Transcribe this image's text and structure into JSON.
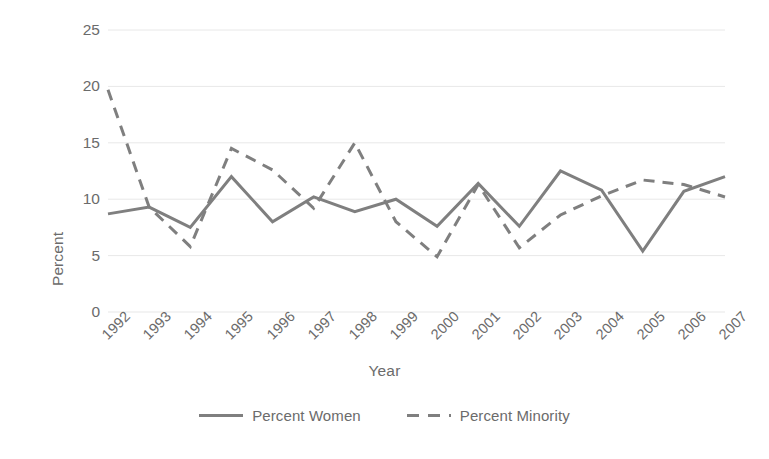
{
  "chart_data": {
    "type": "line",
    "title": "",
    "subtitle": "",
    "xlabel": "Year",
    "ylabel": "Percent",
    "categories": [
      "1992",
      "1993",
      "1994",
      "1995",
      "1996",
      "1997",
      "1998",
      "1999",
      "2000",
      "2001",
      "2002",
      "2003",
      "2004",
      "2005",
      "2006",
      "2007"
    ],
    "x": [
      1992,
      1993,
      1994,
      1995,
      1996,
      1997,
      1998,
      1999,
      2000,
      2001,
      2002,
      2003,
      2004,
      2005,
      2006,
      2007
    ],
    "series": [
      {
        "name": "Percent Women",
        "style": "solid",
        "color": "#7f7f7f",
        "values": [
          8.7,
          9.3,
          7.5,
          12.0,
          8.0,
          10.2,
          8.9,
          10.0,
          7.6,
          11.4,
          7.6,
          12.5,
          10.8,
          5.4,
          10.7,
          12.0
        ]
      },
      {
        "name": "Percent Minority",
        "style": "dashed",
        "color": "#7f7f7f",
        "values": [
          19.7,
          9.3,
          5.8,
          14.5,
          12.6,
          9.2,
          15.0,
          8.0,
          4.9,
          11.3,
          5.7,
          8.6,
          10.3,
          11.7,
          11.3,
          10.2
        ]
      }
    ],
    "ylim": [
      0,
      25
    ],
    "yticks": [
      0,
      5,
      10,
      15,
      20,
      25
    ],
    "ytick_labels": [
      "0",
      "5",
      "10",
      "15",
      "20",
      "25"
    ],
    "xlim": [
      1992,
      2007
    ],
    "grid": "horizontal",
    "gridline_color": "#e8e8e8",
    "legend_position": "bottom",
    "legend": [
      {
        "label": "Percent Women",
        "style": "solid"
      },
      {
        "label": "Percent Minority",
        "style": "dashed"
      }
    ],
    "background": "#ffffff",
    "text_color": "#6b6b6b"
  }
}
